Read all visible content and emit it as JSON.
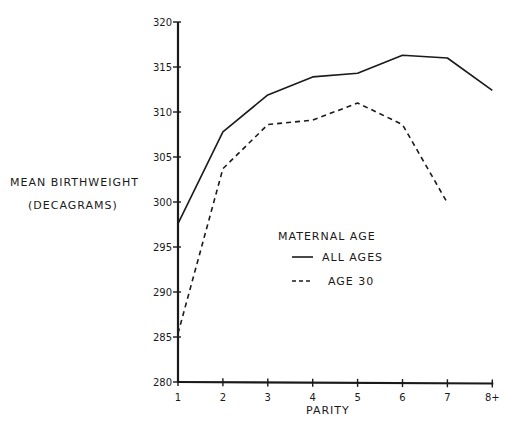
{
  "chart_data": {
    "type": "line",
    "title": "",
    "xlabel": "PARITY",
    "ylabel": "MEAN BIRTHWEIGHT",
    "ylabel_unit": "(DECAGRAMS)",
    "x": [
      1,
      2,
      3,
      4,
      5,
      6,
      7,
      8
    ],
    "x_tick_labels": [
      "1",
      "2",
      "3",
      "4",
      "5",
      "6",
      "7",
      "8+"
    ],
    "y_ticks": [
      280,
      285,
      290,
      295,
      300,
      305,
      310,
      315,
      320
    ],
    "ylim": [
      280,
      320
    ],
    "xlim": [
      1,
      8
    ],
    "grid": false,
    "legend": {
      "title": "MATERNAL AGE",
      "position": "center-right inside plot",
      "entries": [
        {
          "label": "ALL AGES",
          "style": "solid"
        },
        {
          "label": "AGE 30",
          "style": "dashed"
        }
      ]
    },
    "series": [
      {
        "name": "ALL AGES",
        "style": "solid",
        "values": [
          297.6,
          307.8,
          311.9,
          313.9,
          314.3,
          316.3,
          316.0,
          312.4
        ]
      },
      {
        "name": "AGE 30",
        "style": "dashed",
        "values": [
          285.4,
          303.7,
          308.6,
          309.1,
          311.0,
          308.6,
          299.9,
          null
        ]
      }
    ]
  },
  "colors": {
    "ink": "#1a1a1a",
    "background": "#ffffff"
  }
}
